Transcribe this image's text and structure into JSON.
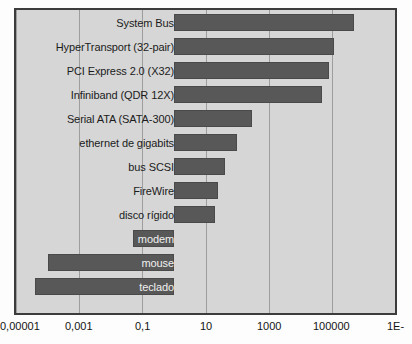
{
  "chart_data": {
    "type": "bar",
    "orientation": "horizontal",
    "title": "",
    "xlabel": "",
    "ylabel": "",
    "xscale": "log",
    "xlim": [
      1e-05,
      10000000
    ],
    "grid": true,
    "legend": null,
    "decimal_separator": ",",
    "categories": [
      "System Bus",
      "HyperTransport (32-pair)",
      "PCI Express 2.0 (X32)",
      "Infiniband (QDR 12X)",
      "Serial ATA (SATA-300)",
      "ethernet de gigabits",
      "bus SCSI",
      "FireWire",
      "disco rígido",
      "modem",
      "mouse",
      "teclado"
    ],
    "values": [
      500000,
      120000,
      80000,
      50000,
      300,
      100,
      40,
      25,
      20,
      0.05,
      0.0001,
      4e-05
    ],
    "baseline": 1,
    "tick_values": [
      1e-05,
      0.001,
      0.1,
      10,
      1000,
      100000,
      10000000
    ],
    "tick_labels": [
      "0,00001",
      "0,001",
      "0,1",
      "10",
      "1000",
      "100000",
      "1E-"
    ],
    "bar_color": "#585858",
    "plot_background": "#d6d6d6",
    "grid_color": "#9d9d9d",
    "frame_color": "#3c3c3c"
  }
}
